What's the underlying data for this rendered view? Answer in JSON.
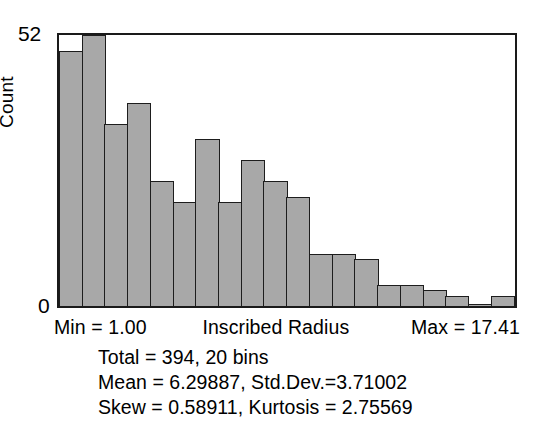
{
  "chart_data": {
    "type": "bar",
    "title": "",
    "xlabel": "Inscribed Radius",
    "ylabel": "Count",
    "ylim": [
      0,
      52
    ],
    "grid": false,
    "legend": null,
    "bins": 20,
    "x_range": [
      1.0,
      17.41
    ],
    "categories": [
      "1",
      "2",
      "3",
      "4",
      "5",
      "6",
      "7",
      "8",
      "9",
      "10",
      "11",
      "12",
      "13",
      "14",
      "15",
      "16",
      "17",
      "18",
      "19",
      "20"
    ],
    "values": [
      49,
      53,
      35,
      39,
      24,
      20,
      32,
      20,
      28,
      24,
      21,
      10,
      10,
      9,
      4,
      4,
      3,
      2,
      0,
      2
    ],
    "y_ticks": [
      "0",
      "52"
    ],
    "annotations": {
      "min": "Min = 1.00",
      "max": "Max = 17.41",
      "total_bins": "Total = 394, 20 bins",
      "mean_std": "Mean = 6.29887, Std.Dev.=3.71002",
      "skew_kurtosis": "Skew = 0.58911, Kurtosis = 2.75569"
    }
  },
  "axis": {
    "y_label": "Count",
    "y_tick_top": "52",
    "y_tick_bottom": "0",
    "x_title": "Inscribed Radius",
    "x_min_label": "Min = 1.00",
    "x_max_label": "Max = 17.41"
  },
  "stats": {
    "line1": "Total = 394, 20 bins",
    "line2": "Mean = 6.29887, Std.Dev.=3.71002",
    "line3": "Skew = 0.58911, Kurtosis = 2.75569"
  },
  "colors": {
    "bar_fill": "#a8a8a8",
    "bar_stroke": "#1d1d1d",
    "frame": "#1a1a1a",
    "text": "#000000",
    "background": "#ffffff"
  }
}
